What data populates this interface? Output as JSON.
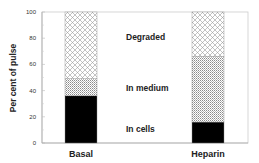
{
  "chart_data": {
    "type": "bar",
    "stacked": true,
    "title": "",
    "xlabel": "",
    "ylabel": "Per cent of pulse",
    "ylim": [
      0,
      100
    ],
    "yticks": [
      0,
      20,
      40,
      60,
      80,
      100
    ],
    "grid": false,
    "categories": [
      "Basal",
      "Heparin"
    ],
    "series": [
      {
        "name": "In cells",
        "values": [
          36,
          16
        ],
        "pattern": "solid-black"
      },
      {
        "name": "In medium",
        "values": [
          13,
          50
        ],
        "pattern": "fine-crosshatch"
      },
      {
        "name": "Degraded",
        "values": [
          51,
          34
        ],
        "pattern": "open-crosshatch"
      }
    ],
    "annotations": [
      {
        "text": "Degraded",
        "y": 80
      },
      {
        "text": "In medium",
        "y": 40
      },
      {
        "text": "In cells",
        "y": 9
      }
    ],
    "legend": "inline-text-labels-between-bars"
  },
  "labels": {
    "ylabel": "Per cent of pulse",
    "ticks": [
      "0",
      "20",
      "40",
      "60",
      "80",
      "100"
    ],
    "categories": [
      "Basal",
      "Heparin"
    ],
    "segments": [
      "Degraded",
      "In medium",
      "In cells"
    ]
  },
  "colors": {
    "cells": "#000000",
    "axis": "#bbbbbb",
    "pattern_stroke": "#999999"
  }
}
